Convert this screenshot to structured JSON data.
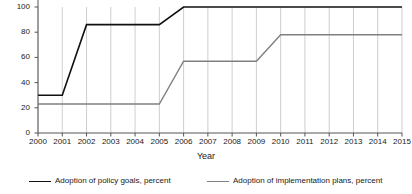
{
  "chart_data": {
    "type": "line",
    "title": "",
    "xlabel": "Year",
    "ylabel": "",
    "x": [
      2000,
      2001,
      2002,
      2003,
      2004,
      2005,
      2006,
      2007,
      2008,
      2009,
      2010,
      2011,
      2012,
      2013,
      2014,
      2015
    ],
    "xtick_labels": [
      "2000",
      "2001",
      "2002",
      "2003",
      "2004",
      "2005",
      "2006",
      "2007",
      "2008",
      "2009",
      "2010",
      "2011",
      "2012",
      "2013",
      "2014",
      "2015"
    ],
    "ytick_labels": [
      "0",
      "20",
      "40",
      "60",
      "80",
      "100"
    ],
    "yticks": [
      0,
      20,
      40,
      60,
      80,
      100
    ],
    "ylim": [
      0,
      100
    ],
    "xlim": [
      2000,
      2015
    ],
    "grid": "vertical",
    "legend_position": "bottom",
    "series": [
      {
        "name": "Adoption of policy goals, percent",
        "color": "#111111",
        "values": [
          30,
          30,
          86,
          86,
          86,
          86,
          100,
          100,
          100,
          100,
          100,
          100,
          100,
          100,
          100,
          100
        ]
      },
      {
        "name": "Adoption of implementation plans, percent",
        "color": "#808080",
        "values": [
          23,
          23,
          23,
          23,
          23,
          23,
          57,
          57,
          57,
          57,
          78,
          78,
          78,
          78,
          78,
          78
        ]
      }
    ]
  }
}
